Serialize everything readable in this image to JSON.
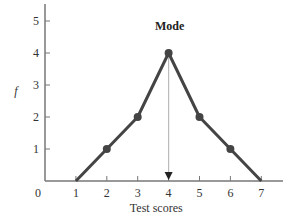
{
  "chart_data": {
    "type": "line",
    "title": "",
    "xlabel": "Test scores",
    "ylabel": "f",
    "x": [
      1,
      2,
      3,
      4,
      5,
      6,
      7
    ],
    "series": [
      {
        "name": "frequency polygon",
        "values": [
          0,
          1,
          2,
          4,
          2,
          1,
          0
        ]
      }
    ],
    "x_ticks": [
      "0",
      "1",
      "2",
      "3",
      "4",
      "5",
      "6",
      "7"
    ],
    "y_ticks": [
      "1",
      "2",
      "3",
      "4",
      "5"
    ],
    "xlim": [
      0,
      7.8
    ],
    "ylim": [
      0,
      5.5
    ],
    "grid": false,
    "annotations": [
      {
        "text": "Mode",
        "x": 4,
        "y": 4,
        "arrow_to": [
          4,
          0
        ]
      }
    ],
    "colors": {
      "line": "#444444",
      "marker": "#444444",
      "axis": "#777777",
      "mode_line": "#bbbbbb"
    }
  }
}
